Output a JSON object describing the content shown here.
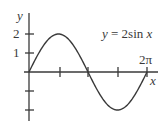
{
  "chart_data": {
    "type": "line",
    "title": "y = 2sin x",
    "equation_label": "y = 2sin x",
    "xlabel": "x",
    "ylabel": "y",
    "x_tick_label": "2π",
    "y_tick_labels": [
      "2",
      "1"
    ],
    "x_ticks": [
      "π/2",
      "π",
      "3π/2",
      "2π"
    ],
    "y_ticks": [
      2,
      1,
      -1,
      -2
    ],
    "xlim": [
      0,
      6.2832
    ],
    "ylim": [
      -2,
      2
    ],
    "grid": false,
    "series": [
      {
        "name": "y = 2sin x",
        "x": [
          0,
          0.7854,
          1.5708,
          2.3562,
          3.1416,
          3.927,
          4.7124,
          5.4978,
          6.2832
        ],
        "values": [
          0,
          1.414,
          2,
          1.414,
          0,
          -1.414,
          -2,
          -1.414,
          0
        ]
      }
    ],
    "colors": {
      "curve": "#3a3a3a",
      "axes": "#3a3a3a"
    }
  }
}
